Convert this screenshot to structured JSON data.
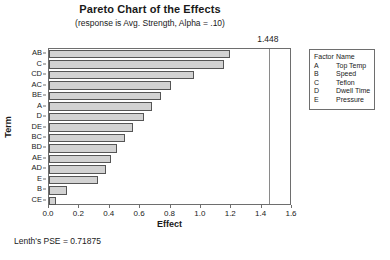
{
  "chart_data": {
    "type": "bar",
    "orientation": "horizontal",
    "title": "Pareto Chart of the Effects",
    "subtitle": "(response is Avg. Strength, Alpha = .10)",
    "xlabel": "Effect",
    "ylabel": "Term",
    "xlim": [
      0.0,
      1.6
    ],
    "xticks": [
      "0.0",
      "0.2",
      "0.4",
      "0.6",
      "0.8",
      "1.0",
      "1.2",
      "1.4",
      "1.6"
    ],
    "xtick_values": [
      0.0,
      0.2,
      0.4,
      0.6,
      0.8,
      1.0,
      1.2,
      1.4,
      1.6
    ],
    "grid": false,
    "legend_position": "right",
    "categories": [
      "AB",
      "C",
      "CD",
      "AC",
      "BE",
      "A",
      "D",
      "DE",
      "BC",
      "BD",
      "AE",
      "AD",
      "E",
      "B",
      "CE"
    ],
    "values": [
      1.195,
      1.155,
      0.955,
      0.805,
      0.735,
      0.675,
      0.625,
      0.555,
      0.5,
      0.45,
      0.41,
      0.375,
      0.325,
      0.12,
      0.045
    ],
    "bar_fill_color": "#d2d2d2",
    "bar_edge_color": "#555555",
    "reference_line": {
      "value": 1.448,
      "label": "1.448",
      "color": "#8a8a8a"
    },
    "annotation": "Lenth's PSE = 0.71875"
  },
  "legend": {
    "header": {
      "code": "Factor",
      "name": "Name"
    },
    "rows": [
      {
        "code": "A",
        "name": "Top Temp"
      },
      {
        "code": "B",
        "name": "Speed"
      },
      {
        "code": "C",
        "name": "Teflon"
      },
      {
        "code": "D",
        "name": "Dwell Time"
      },
      {
        "code": "E",
        "name": "Pressure"
      }
    ]
  }
}
